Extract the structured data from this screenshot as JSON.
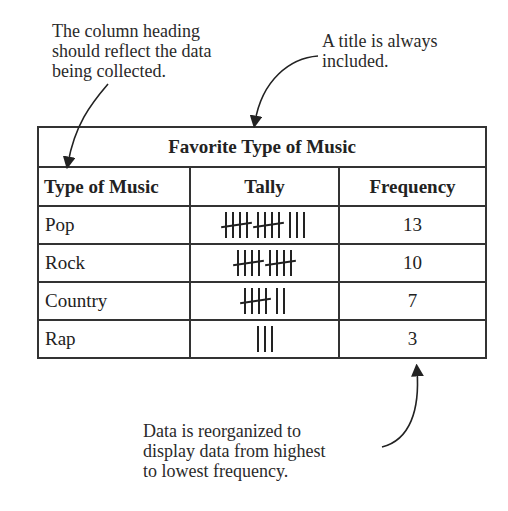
{
  "annotations": {
    "column_heading_note": [
      "The column heading",
      "should reflect the data",
      "being collected."
    ],
    "title_note": [
      "A title is always",
      "included."
    ],
    "order_note": [
      "Data is reorganized to",
      "display data from highest",
      "to lowest frequency."
    ]
  },
  "table": {
    "title": "Favorite Type of Music",
    "headers": [
      "Type of Music",
      "Tally",
      "Frequency"
    ],
    "rows": [
      {
        "type": "Pop",
        "tally": 13,
        "frequency": "13"
      },
      {
        "type": "Rock",
        "tally": 10,
        "frequency": "10"
      },
      {
        "type": "Country",
        "tally": 7,
        "frequency": "7"
      },
      {
        "type": "Rap",
        "tally": 3,
        "frequency": "3"
      }
    ]
  },
  "chart_data": {
    "type": "table",
    "title": "Favorite Type of Music",
    "columns": [
      "Type of Music",
      "Tally",
      "Frequency"
    ],
    "categories": [
      "Pop",
      "Rock",
      "Country",
      "Rap"
    ],
    "values": [
      13,
      10,
      7,
      3
    ]
  }
}
